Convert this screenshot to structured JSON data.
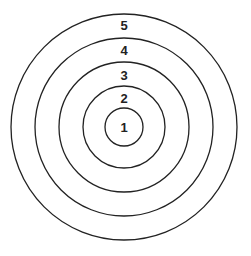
{
  "diagram": {
    "type": "concentric-circles",
    "center": {
      "x": 124,
      "y": 127
    },
    "stroke_color": "#222222",
    "background": "#ffffff",
    "rings": [
      {
        "label": "1",
        "radius": 19,
        "label_y": 131
      },
      {
        "label": "2",
        "radius": 41,
        "label_y": 102
      },
      {
        "label": "3",
        "radius": 65,
        "label_y": 80
      },
      {
        "label": "4",
        "radius": 89,
        "label_y": 55
      },
      {
        "label": "5",
        "radius": 113,
        "label_y": 30
      }
    ]
  }
}
